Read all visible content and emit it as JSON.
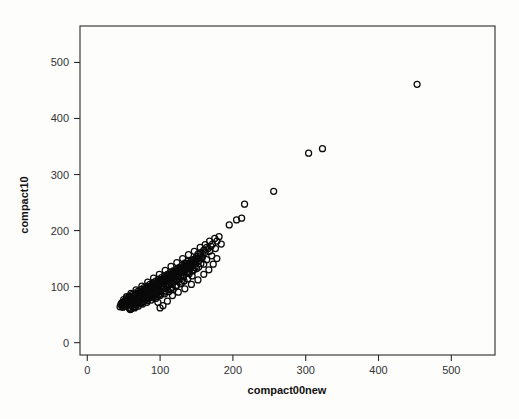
{
  "chart_data": {
    "type": "scatter",
    "title": "",
    "xlabel": "compact00new",
    "ylabel": "compact10",
    "xlim": [
      -10,
      560
    ],
    "ylim": [
      -22,
      565
    ],
    "xticks": [
      0,
      100,
      200,
      300,
      400,
      500
    ],
    "yticks": [
      0,
      100,
      200,
      300,
      400,
      500
    ],
    "xtick_labels": [
      "0",
      "100",
      "200",
      "300",
      "400",
      "500"
    ],
    "ytick_labels": [
      "0",
      "100",
      "200",
      "300",
      "400",
      "500"
    ],
    "grid": false,
    "legend": "none",
    "marker": {
      "shape": "circle-open",
      "size_px": 6,
      "stroke": "#0a0a0a",
      "stroke_width": 1.25,
      "fill": "none"
    },
    "frame": {
      "visible": true,
      "color": "#2b2b2b"
    },
    "series": [
      {
        "name": "compact10 vs compact00new",
        "points": [
          [
            453,
            461
          ],
          [
            323,
            346
          ],
          [
            304,
            338
          ],
          [
            256,
            270
          ],
          [
            216,
            247
          ],
          [
            212,
            222
          ],
          [
            205,
            219
          ],
          [
            195,
            210
          ],
          [
            181,
            189
          ],
          [
            178,
            181
          ],
          [
            175,
            186
          ],
          [
            172,
            176
          ],
          [
            170,
            172
          ],
          [
            168,
            181
          ],
          [
            166,
            168
          ],
          [
            164,
            170
          ],
          [
            162,
            161
          ],
          [
            160,
            165
          ],
          [
            159,
            158
          ],
          [
            158,
            152
          ],
          [
            156,
            160
          ],
          [
            155,
            155
          ],
          [
            154,
            147
          ],
          [
            153,
            151
          ],
          [
            152,
            158
          ],
          [
            151,
            149
          ],
          [
            150,
            153
          ],
          [
            149,
            145
          ],
          [
            148,
            150
          ],
          [
            147,
            143
          ],
          [
            146,
            148
          ],
          [
            146,
            139
          ],
          [
            145,
            146
          ],
          [
            144,
            141
          ],
          [
            143,
            147
          ],
          [
            143,
            136
          ],
          [
            142,
            144
          ],
          [
            141,
            138
          ],
          [
            140,
            142
          ],
          [
            140,
            134
          ],
          [
            139,
            140
          ],
          [
            138,
            136
          ],
          [
            138,
            145
          ],
          [
            137,
            133
          ],
          [
            136,
            139
          ],
          [
            136,
            131
          ],
          [
            135,
            137
          ],
          [
            134,
            134
          ],
          [
            134,
            142
          ],
          [
            133,
            130
          ],
          [
            132,
            136
          ],
          [
            132,
            128
          ],
          [
            131,
            133
          ],
          [
            130,
            131
          ],
          [
            130,
            138
          ],
          [
            129,
            127
          ],
          [
            128,
            132
          ],
          [
            128,
            125
          ],
          [
            127,
            130
          ],
          [
            126,
            128
          ],
          [
            126,
            134
          ],
          [
            125,
            124
          ],
          [
            124,
            129
          ],
          [
            124,
            122
          ],
          [
            123,
            127
          ],
          [
            122,
            125
          ],
          [
            122,
            131
          ],
          [
            121,
            121
          ],
          [
            120,
            126
          ],
          [
            120,
            119
          ],
          [
            119,
            124
          ],
          [
            118,
            122
          ],
          [
            118,
            128
          ],
          [
            117,
            118
          ],
          [
            116,
            123
          ],
          [
            116,
            116
          ],
          [
            115,
            121
          ],
          [
            114,
            119
          ],
          [
            114,
            125
          ],
          [
            113,
            115
          ],
          [
            112,
            120
          ],
          [
            112,
            113
          ],
          [
            111,
            118
          ],
          [
            110,
            116
          ],
          [
            110,
            122
          ],
          [
            109,
            112
          ],
          [
            108,
            117
          ],
          [
            108,
            110
          ],
          [
            107,
            115
          ],
          [
            106,
            113
          ],
          [
            106,
            119
          ],
          [
            105,
            109
          ],
          [
            104,
            114
          ],
          [
            104,
            107
          ],
          [
            103,
            112
          ],
          [
            102,
            110
          ],
          [
            102,
            116
          ],
          [
            101,
            106
          ],
          [
            100,
            111
          ],
          [
            100,
            104
          ],
          [
            99,
            109
          ],
          [
            98,
            107
          ],
          [
            98,
            113
          ],
          [
            97,
            103
          ],
          [
            96,
            108
          ],
          [
            96,
            101
          ],
          [
            95,
            106
          ],
          [
            94,
            104
          ],
          [
            94,
            110
          ],
          [
            93,
            100
          ],
          [
            92,
            105
          ],
          [
            92,
            98
          ],
          [
            91,
            103
          ],
          [
            90,
            101
          ],
          [
            90,
            107
          ],
          [
            89,
            97
          ],
          [
            88,
            102
          ],
          [
            88,
            95
          ],
          [
            87,
            100
          ],
          [
            86,
            98
          ],
          [
            86,
            104
          ],
          [
            85,
            94
          ],
          [
            84,
            99
          ],
          [
            84,
            92
          ],
          [
            83,
            97
          ],
          [
            82,
            95
          ],
          [
            82,
            101
          ],
          [
            81,
            91
          ],
          [
            80,
            96
          ],
          [
            80,
            89
          ],
          [
            79,
            94
          ],
          [
            78,
            92
          ],
          [
            78,
            98
          ],
          [
            77,
            88
          ],
          [
            76,
            93
          ],
          [
            76,
            86
          ],
          [
            75,
            91
          ],
          [
            74,
            89
          ],
          [
            74,
            95
          ],
          [
            73,
            85
          ],
          [
            72,
            90
          ],
          [
            72,
            83
          ],
          [
            71,
            88
          ],
          [
            70,
            86
          ],
          [
            70,
            92
          ],
          [
            69,
            82
          ],
          [
            68,
            87
          ],
          [
            68,
            80
          ],
          [
            67,
            85
          ],
          [
            66,
            83
          ],
          [
            66,
            89
          ],
          [
            65,
            79
          ],
          [
            64,
            84
          ],
          [
            64,
            77
          ],
          [
            63,
            82
          ],
          [
            62,
            80
          ],
          [
            62,
            86
          ],
          [
            61,
            76
          ],
          [
            60,
            81
          ],
          [
            60,
            74
          ],
          [
            59,
            79
          ],
          [
            58,
            77
          ],
          [
            58,
            83
          ],
          [
            57,
            73
          ],
          [
            56,
            78
          ],
          [
            56,
            71
          ],
          [
            55,
            76
          ],
          [
            54,
            74
          ],
          [
            54,
            80
          ],
          [
            53,
            70
          ],
          [
            52,
            75
          ],
          [
            52,
            68
          ],
          [
            51,
            73
          ],
          [
            50,
            71
          ],
          [
            50,
            77
          ],
          [
            49,
            67
          ],
          [
            48,
            72
          ],
          [
            48,
            65
          ],
          [
            47,
            70
          ],
          [
            46,
            68
          ],
          [
            45,
            64
          ],
          [
            150,
            132
          ],
          [
            145,
            128
          ],
          [
            140,
            127
          ],
          [
            136,
            124
          ],
          [
            132,
            120
          ],
          [
            128,
            117
          ],
          [
            124,
            113
          ],
          [
            120,
            110
          ],
          [
            116,
            107
          ],
          [
            112,
            103
          ],
          [
            108,
            100
          ],
          [
            104,
            97
          ],
          [
            100,
            93
          ],
          [
            96,
            90
          ],
          [
            92,
            87
          ],
          [
            88,
            83
          ],
          [
            84,
            80
          ],
          [
            80,
            77
          ],
          [
            76,
            73
          ],
          [
            72,
            70
          ],
          [
            68,
            67
          ],
          [
            64,
            63
          ],
          [
            60,
            60
          ],
          [
            133,
            110
          ],
          [
            128,
            105
          ],
          [
            122,
            100
          ],
          [
            115,
            95
          ],
          [
            108,
            92
          ],
          [
            101,
            88
          ],
          [
            95,
            85
          ],
          [
            89,
            81
          ],
          [
            83,
            78
          ],
          [
            77,
            74
          ],
          [
            71,
            71
          ],
          [
            66,
            68
          ],
          [
            61,
            66
          ],
          [
            57,
            63
          ],
          [
            100,
            62
          ],
          [
            104,
            66
          ],
          [
            97,
            72
          ],
          [
            110,
            74
          ],
          [
            117,
            84
          ],
          [
            125,
            90
          ],
          [
            134,
            96
          ],
          [
            143,
            104
          ],
          [
            152,
            112
          ],
          [
            160,
            122
          ],
          [
            167,
            130
          ],
          [
            173,
            140
          ],
          [
            178,
            150
          ],
          [
            155,
            170
          ],
          [
            147,
            163
          ],
          [
            139,
            157
          ],
          [
            131,
            150
          ],
          [
            123,
            143
          ],
          [
            115,
            136
          ],
          [
            107,
            129
          ],
          [
            99,
            122
          ],
          [
            91,
            115
          ],
          [
            83,
            108
          ],
          [
            75,
            101
          ],
          [
            67,
            94
          ],
          [
            60,
            88
          ],
          [
            54,
            82
          ],
          [
            162,
            175
          ],
          [
            168,
            163
          ],
          [
            157,
            151
          ],
          [
            149,
            144
          ],
          [
            141,
            132
          ],
          [
            133,
            126
          ],
          [
            125,
            119
          ],
          [
            118,
            112
          ],
          [
            110,
            105
          ],
          [
            102,
            99
          ],
          [
            94,
            93
          ],
          [
            86,
            87
          ],
          [
            78,
            81
          ],
          [
            70,
            76
          ],
          [
            63,
            72
          ],
          [
            56,
            69
          ],
          [
            51,
            66
          ],
          [
            184,
            176
          ],
          [
            176,
            168
          ],
          [
            171,
            155
          ],
          [
            164,
            148
          ],
          [
            156,
            141
          ],
          [
            148,
            134
          ],
          [
            140,
            123
          ],
          [
            132,
            117
          ],
          [
            124,
            110
          ],
          [
            117,
            104
          ],
          [
            109,
            98
          ],
          [
            101,
            91
          ],
          [
            93,
            86
          ],
          [
            85,
            82
          ],
          [
            77,
            78
          ],
          [
            69,
            75
          ],
          [
            62,
            71
          ],
          [
            55,
            67
          ],
          [
            49,
            63
          ],
          [
            118,
            95
          ],
          [
            112,
            91
          ],
          [
            106,
            87
          ],
          [
            100,
            84
          ],
          [
            94,
            79
          ],
          [
            88,
            76
          ],
          [
            82,
            72
          ],
          [
            76,
            69
          ],
          [
            70,
            65
          ],
          [
            65,
            62
          ],
          [
            59,
            59
          ],
          [
            144,
            119
          ],
          [
            138,
            114
          ],
          [
            130,
            108
          ],
          [
            122,
            102
          ],
          [
            114,
            96
          ],
          [
            106,
            90
          ],
          [
            98,
            85
          ],
          [
            90,
            80
          ],
          [
            82,
            75
          ],
          [
            74,
            70
          ],
          [
            66,
            64
          ],
          [
            58,
            61
          ],
          [
            160,
            140
          ],
          [
            153,
            135
          ],
          [
            146,
            130
          ],
          [
            139,
            125
          ],
          [
            132,
            121
          ],
          [
            126,
            115
          ],
          [
            119,
            109
          ],
          [
            112,
            105
          ],
          [
            105,
            101
          ],
          [
            98,
            96
          ],
          [
            91,
            91
          ],
          [
            84,
            86
          ],
          [
            77,
            82
          ],
          [
            71,
            77
          ],
          [
            64,
            73
          ],
          [
            58,
            70
          ],
          [
            52,
            66
          ]
        ]
      }
    ]
  }
}
